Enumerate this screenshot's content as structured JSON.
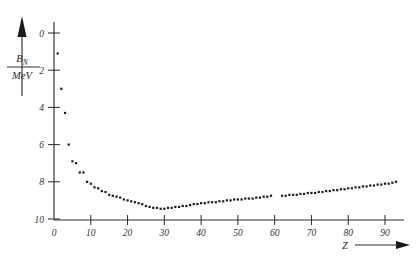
{
  "figure": {
    "background_color": "#ffffff",
    "ink_color": "#1a1a1a"
  },
  "yaxis": {
    "label_numerator": "B",
    "label_subscript": "N",
    "label_denominator": "MeV",
    "label_full": "B_N / MeV",
    "arrow_name": "y-axis-arrow",
    "ticks": [
      "0",
      "2",
      "4",
      "6",
      "8",
      "10"
    ]
  },
  "xaxis": {
    "label": "Z",
    "arrow_name": "x-axis-arrow",
    "ticks": [
      "0",
      "10",
      "20",
      "30",
      "40",
      "50",
      "60",
      "70",
      "80",
      "90"
    ]
  },
  "chart_data": {
    "type": "scatter",
    "title": "",
    "subtitle": "",
    "xlabel": "Z",
    "ylabel": "B_N / MeV",
    "xlim": [
      0,
      95
    ],
    "ylim": [
      0,
      10
    ],
    "y_axis_inverted": true,
    "grid": false,
    "legend": null,
    "marker": "square",
    "marker_size_px": 2.2,
    "x_ticks": [
      0,
      10,
      20,
      30,
      40,
      50,
      60,
      70,
      80,
      90
    ],
    "y_ticks": [
      0,
      2,
      4,
      6,
      8,
      10
    ],
    "series": [
      {
        "name": "B_N",
        "points": [
          [
            1,
            1.1
          ],
          [
            2,
            3.0
          ],
          [
            3,
            4.3
          ],
          [
            4,
            6.0
          ],
          [
            5,
            6.9
          ],
          [
            6,
            7.0
          ],
          [
            7,
            7.5
          ],
          [
            8,
            7.5
          ],
          [
            9,
            8.0
          ],
          [
            10,
            8.1
          ],
          [
            11,
            8.3
          ],
          [
            12,
            8.35
          ],
          [
            13,
            8.5
          ],
          [
            14,
            8.55
          ],
          [
            15,
            8.7
          ],
          [
            16,
            8.75
          ],
          [
            17,
            8.8
          ],
          [
            18,
            8.85
          ],
          [
            19,
            8.95
          ],
          [
            20,
            9.0
          ],
          [
            21,
            9.05
          ],
          [
            22,
            9.1
          ],
          [
            23,
            9.15
          ],
          [
            24,
            9.2
          ],
          [
            25,
            9.3
          ],
          [
            26,
            9.35
          ],
          [
            27,
            9.4
          ],
          [
            28,
            9.4
          ],
          [
            29,
            9.45
          ],
          [
            30,
            9.45
          ],
          [
            31,
            9.4
          ],
          [
            32,
            9.4
          ],
          [
            33,
            9.35
          ],
          [
            34,
            9.35
          ],
          [
            35,
            9.3
          ],
          [
            36,
            9.3
          ],
          [
            37,
            9.25
          ],
          [
            38,
            9.2
          ],
          [
            39,
            9.2
          ],
          [
            40,
            9.15
          ],
          [
            41,
            9.15
          ],
          [
            42,
            9.1
          ],
          [
            43,
            9.1
          ],
          [
            44,
            9.1
          ],
          [
            45,
            9.05
          ],
          [
            46,
            9.05
          ],
          [
            47,
            9.0
          ],
          [
            48,
            9.0
          ],
          [
            49,
            8.95
          ],
          [
            50,
            8.95
          ],
          [
            51,
            8.95
          ],
          [
            52,
            8.9
          ],
          [
            53,
            8.9
          ],
          [
            54,
            8.9
          ],
          [
            55,
            8.85
          ],
          [
            56,
            8.85
          ],
          [
            57,
            8.8
          ],
          [
            58,
            8.8
          ],
          [
            59,
            8.75
          ],
          [
            62,
            8.75
          ],
          [
            63,
            8.75
          ],
          [
            64,
            8.7
          ],
          [
            65,
            8.7
          ],
          [
            66,
            8.7
          ],
          [
            67,
            8.65
          ],
          [
            68,
            8.65
          ],
          [
            69,
            8.6
          ],
          [
            70,
            8.6
          ],
          [
            71,
            8.6
          ],
          [
            72,
            8.55
          ],
          [
            73,
            8.55
          ],
          [
            74,
            8.5
          ],
          [
            75,
            8.5
          ],
          [
            76,
            8.45
          ],
          [
            77,
            8.45
          ],
          [
            78,
            8.4
          ],
          [
            79,
            8.4
          ],
          [
            80,
            8.35
          ],
          [
            81,
            8.35
          ],
          [
            82,
            8.3
          ],
          [
            83,
            8.3
          ],
          [
            84,
            8.25
          ],
          [
            85,
            8.25
          ],
          [
            86,
            8.2
          ],
          [
            87,
            8.2
          ],
          [
            88,
            8.15
          ],
          [
            89,
            8.15
          ],
          [
            90,
            8.1
          ],
          [
            91,
            8.1
          ],
          [
            92,
            8.05
          ],
          [
            93,
            8.0
          ]
        ]
      }
    ]
  }
}
